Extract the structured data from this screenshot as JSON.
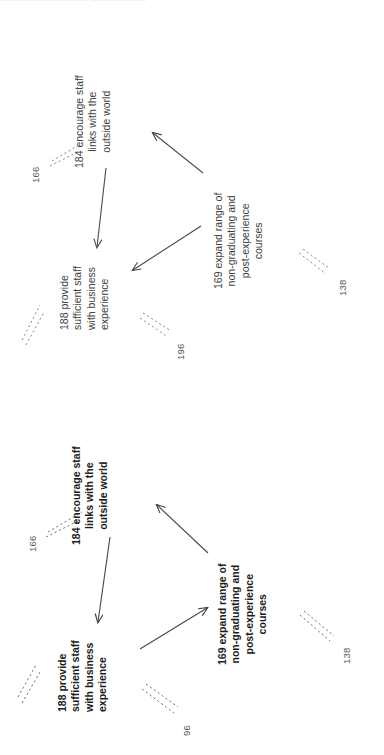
{
  "document": {
    "type": "concept-map-diagram",
    "orientation": "rotated-90-counterclockwise",
    "page_width": 384,
    "page_height": 755,
    "background_color": "#ffffff",
    "ink_color": "#404040",
    "top_clipped_text": "▬▬▬▬▬  ▬▬▬▬  ▬▬▬▬▬▬"
  },
  "panels": [
    {
      "id": "panel-top",
      "weight": "regular",
      "nodes": [
        {
          "id": "node-184-top",
          "code": "184",
          "lines": [
            "184 encourage staff",
            "links with the",
            "outside world"
          ],
          "text": "184 encourage staff links with the outside world"
        },
        {
          "id": "node-188-top",
          "code": "188",
          "lines": [
            "188 provide",
            "sufficient staff",
            "with business",
            "experience"
          ],
          "text": "188 provide sufficient staff with business experience"
        },
        {
          "id": "node-169-top",
          "code": "169",
          "lines": [
            "169 expand range of",
            "non-graduating and",
            "post-experience",
            "courses"
          ],
          "text": "169 expand range of non-graduating and post-experience courses"
        }
      ],
      "peripheral_labels": [
        {
          "id": "label-166-top",
          "value": "166"
        },
        {
          "id": "label-196-top",
          "value": "196"
        },
        {
          "id": "label-138-top",
          "value": "138"
        }
      ],
      "edges": [
        {
          "id": "edge-184-to-188-top",
          "from": "184",
          "to": "188",
          "style": "solid",
          "arrow": "single"
        },
        {
          "id": "edge-169-to-184-top",
          "from": "169",
          "to": "184",
          "style": "solid",
          "arrow": "single"
        },
        {
          "id": "edge-169-to-188-top",
          "from": "169",
          "to": "188",
          "style": "solid",
          "arrow": "single"
        }
      ]
    },
    {
      "id": "panel-bottom",
      "weight": "bold",
      "nodes": [
        {
          "id": "node-184-bottom",
          "code": "184",
          "lines": [
            "184 encourage staff",
            "links with the",
            "outside world"
          ],
          "text": "184 encourage staff links with the outside world"
        },
        {
          "id": "node-188-bottom",
          "code": "188",
          "lines": [
            "188 provide",
            "sufficient staff",
            "with business",
            "experience"
          ],
          "text": "188 provide sufficient staff with business experience"
        },
        {
          "id": "node-169-bottom",
          "code": "169",
          "lines": [
            "169 expand range of",
            "non-graduating and",
            "post-experience",
            "courses"
          ],
          "text": "169 expand range of non-graduating and post-experience courses"
        }
      ],
      "peripheral_labels": [
        {
          "id": "label-166-bottom",
          "value": "166"
        },
        {
          "id": "label-96-bottom",
          "value": "96"
        },
        {
          "id": "label-138-bottom",
          "value": "138"
        }
      ],
      "edges": [
        {
          "id": "edge-184-to-188-bottom",
          "from": "184",
          "to": "188",
          "style": "solid",
          "arrow": "single"
        },
        {
          "id": "edge-169-to-184-bottom",
          "from": "169",
          "to": "184",
          "style": "solid",
          "arrow": "single"
        },
        {
          "id": "edge-188-to-169-bottom",
          "from": "188",
          "to": "169",
          "style": "solid",
          "arrow": "single"
        }
      ]
    }
  ]
}
